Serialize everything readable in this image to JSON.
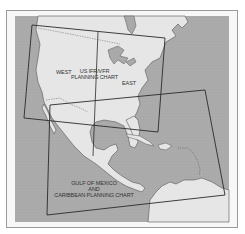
{
  "map": {
    "colors": {
      "ocean": "#a9a9a9",
      "land": "#e6e6e6",
      "coast": "#555555",
      "chart_boundary": "#2a2a2a",
      "frame": "#9a9a9a"
    },
    "labels": {
      "west": "WEST",
      "us_chart_line1": "US IFR/VFR",
      "us_chart_line2": "PLANNING CHART",
      "east": "EAST",
      "gulf_line1": "GULF OF MEXICO",
      "gulf_line2": "AND",
      "gulf_line3": "CARIBBEAN PLANNING CHART"
    },
    "chart_areas": [
      {
        "name": "US IFR/VFR Planning Chart",
        "polygon": [
          [
            32,
            25
          ],
          [
            165,
            38
          ],
          [
            158,
            132
          ],
          [
            24,
            118
          ]
        ],
        "divider": "WEST / EAST"
      },
      {
        "name": "Gulf of Mexico and Caribbean Planning Chart",
        "polygon": [
          [
            50,
            105
          ],
          [
            205,
            90
          ],
          [
            225,
            195
          ],
          [
            47,
            215
          ]
        ]
      }
    ]
  }
}
